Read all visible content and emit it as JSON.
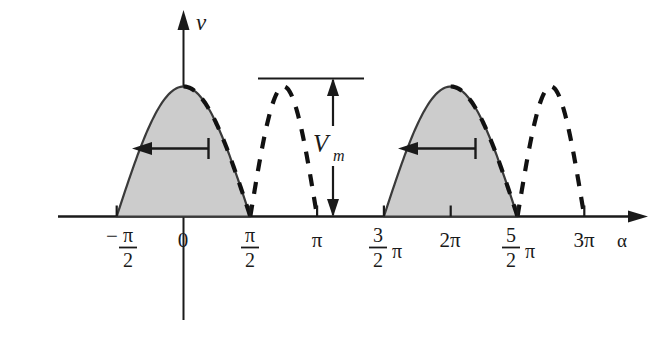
{
  "figure": {
    "title": "",
    "axis": {
      "y_label": "v",
      "x_label": "α"
    },
    "annotations": {
      "amplitude_label_main": "V",
      "amplitude_label_sub": "m"
    },
    "x_tick_labels": [
      {
        "id": "neg-half-pi",
        "type": "fraction",
        "sign": "−",
        "num": "π",
        "den": "2",
        "trail": "",
        "x": 123
      },
      {
        "id": "zero",
        "type": "plain",
        "text": "0",
        "x": 183
      },
      {
        "id": "half-pi",
        "type": "fraction",
        "sign": "",
        "num": "π",
        "den": "2",
        "trail": "",
        "x": 250
      },
      {
        "id": "pi",
        "type": "plain",
        "text": "π",
        "x": 317
      },
      {
        "id": "three-half-pi",
        "type": "fraction",
        "sign": "",
        "num": "3",
        "den": "2",
        "trail": "π",
        "x": 384
      },
      {
        "id": "two-pi",
        "type": "plain",
        "text": "2π",
        "x": 450
      },
      {
        "id": "five-half-pi",
        "type": "fraction",
        "sign": "",
        "num": "5",
        "den": "2",
        "trail": "π",
        "x": 517
      },
      {
        "id": "three-pi",
        "type": "plain",
        "text": "3π",
        "x": 584
      }
    ]
  },
  "chart_data": {
    "type": "line",
    "title": "",
    "xlabel": "α",
    "ylabel": "v",
    "xlim": [
      -2.2,
      10.2
    ],
    "ylim": [
      0,
      1.12
    ],
    "grid": false,
    "legend": null,
    "x_tick_values": [
      -1.5708,
      0,
      1.5708,
      3.1416,
      4.7124,
      6.2832,
      7.854,
      9.4248
    ],
    "x_tick_labels": [
      "-π/2",
      "0",
      "π/2",
      "π",
      "3π/2",
      "2π",
      "5π/2",
      "3π"
    ],
    "annotations": [
      {
        "text": "V_m",
        "type": "double-arrow-vertical",
        "x": 3.98,
        "y_from": 0,
        "y_to": 1.0
      },
      {
        "text": "",
        "type": "reference-line-horizontal",
        "y": 1.0,
        "x_from": 2.25,
        "x_to": 5.0
      },
      {
        "text": "",
        "type": "arrow-left",
        "y": 0.53,
        "x_from": 0.0,
        "x_to": -0.92
      },
      {
        "text": "",
        "type": "arrow-left",
        "y": 0.53,
        "x_from": 6.2832,
        "x_to": 5.36
      }
    ],
    "series": [
      {
        "name": "output voltage (shaded, solid)",
        "style": "solid-filled",
        "fill": "#cfcfcf",
        "stroke": "#3a3a3a",
        "description": "cos-shaped humps over [-π/2, π/2] and [3π/2, 5π/2], amplitude V_m",
        "segments": [
          {
            "x_from": -1.5708,
            "x_to": 1.5708,
            "peak_x": 0.0,
            "peak_y": 1.0
          },
          {
            "x_from": 4.7124,
            "x_to": 7.854,
            "peak_x": 6.2832,
            "peak_y": 1.0
          }
        ]
      },
      {
        "name": "source voltage (dashed)",
        "style": "dashed",
        "stroke": "#111111",
        "description": "sine humps phase shifted, peaks at π/2 and 5π/2 falling to zero at π and 3π",
        "segments": [
          {
            "x_from": -1.5708,
            "x_to": 1.5708,
            "peak_x": 0.0,
            "peak_y": 1.0,
            "visible_from": 0.0
          },
          {
            "x_from": 1.5708,
            "x_to": 3.1416,
            "peak_x": 1.5708,
            "peak_y": 1.0
          },
          {
            "x_from": 4.7124,
            "x_to": 7.854,
            "peak_x": 6.2832,
            "peak_y": 1.0,
            "visible_from": 6.2832
          },
          {
            "x_from": 7.854,
            "x_to": 9.4248,
            "peak_x": 7.854,
            "peak_y": 1.0
          }
        ]
      }
    ]
  }
}
